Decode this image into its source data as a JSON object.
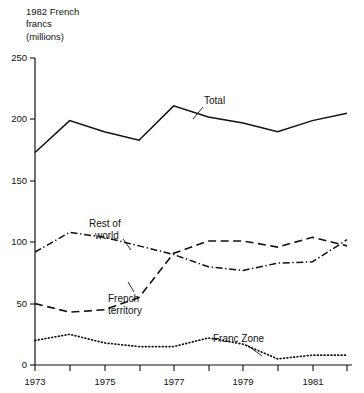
{
  "chart_data": {
    "type": "line",
    "title": "",
    "ylabel": "1982 French\nfrancs\n(millions)",
    "xlabel": "",
    "ylim": [
      0,
      250
    ],
    "xlim": [
      1973,
      1982
    ],
    "yticks": [
      0,
      50,
      100,
      150,
      200,
      250
    ],
    "ytick_labels": [
      "0",
      "50",
      "100",
      "150",
      "200",
      "250"
    ],
    "xticks": [
      1973,
      1974,
      1975,
      1976,
      1977,
      1978,
      1979,
      1980,
      1981,
      1982
    ],
    "xtick_labels": [
      "1973",
      "",
      "1975",
      "",
      "1977",
      "",
      "1979",
      "",
      "1981",
      ""
    ],
    "grid": false,
    "legend_position": "inline-annotations",
    "x": [
      1973,
      1974,
      1975,
      1976,
      1977,
      1978,
      1979,
      1980,
      1981,
      1982
    ],
    "series": [
      {
        "name": "Total",
        "style": "solid",
        "values": [
          173,
          199,
          190,
          183,
          211,
          202,
          197,
          190,
          199,
          205
        ]
      },
      {
        "name": "Rest of world",
        "style": "dash-dot",
        "values": [
          92,
          108,
          104,
          97,
          90,
          80,
          77,
          83,
          84,
          102
        ]
      },
      {
        "name": "French territory",
        "style": "dashed",
        "values": [
          50,
          43,
          45,
          55,
          91,
          101,
          101,
          96,
          104,
          97
        ]
      },
      {
        "name": "Franc Zone",
        "style": "dotted",
        "values": [
          20,
          25,
          18,
          15,
          15,
          22,
          17,
          5,
          8,
          8
        ]
      }
    ],
    "annotations": [
      {
        "label": "Total",
        "x": 204,
        "y": 103
      },
      {
        "label": "Rest of",
        "x": 89,
        "y": 224
      },
      {
        "label": "world",
        "x": 95,
        "y": 236
      },
      {
        "label": "French",
        "x": 108,
        "y": 298
      },
      {
        "label": "territory",
        "x": 108,
        "y": 310
      },
      {
        "label": "Franc Zone",
        "x": 213,
        "y": 341
      }
    ]
  }
}
